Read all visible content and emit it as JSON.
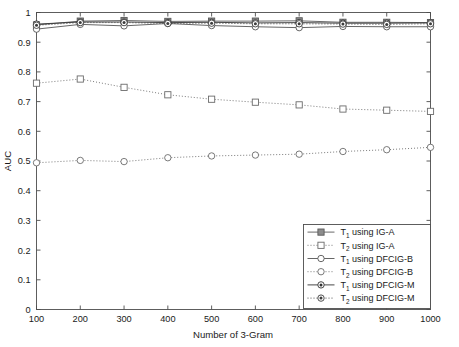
{
  "chart_data": {
    "type": "line",
    "title": "",
    "xlabel": "Number of 3-Gram",
    "ylabel": "AUC",
    "xlim": [
      100,
      1000
    ],
    "ylim": [
      0,
      1
    ],
    "grid": false,
    "legend_position": "lower right",
    "x": [
      100,
      200,
      300,
      400,
      500,
      600,
      700,
      800,
      900,
      1000
    ],
    "xticks": [
      "100",
      "200",
      "300",
      "400",
      "500",
      "600",
      "700",
      "800",
      "900",
      "1000"
    ],
    "yticks": [
      "0",
      "0.1",
      "0.2",
      "0.3",
      "0.4",
      "0.5",
      "0.6",
      "0.7",
      "0.8",
      "0.9",
      "1"
    ],
    "series": [
      {
        "name": "T_1 using IG-A",
        "label_main": "T",
        "label_sub": "1",
        "label_rest": " using IG-A",
        "line": "solid",
        "marker": "square-filled-gray",
        "color": "#595959",
        "values": [
          0.958,
          0.971,
          0.973,
          0.97,
          0.971,
          0.971,
          0.972,
          0.967,
          0.967,
          0.966
        ]
      },
      {
        "name": "T_2 using IG-A",
        "label_main": "T",
        "label_sub": "2",
        "label_rest": " using IG-A",
        "line": "dotted",
        "marker": "square-open",
        "color": "#6b6b6b",
        "values": [
          0.762,
          0.776,
          0.748,
          0.723,
          0.708,
          0.698,
          0.689,
          0.675,
          0.671,
          0.667
        ]
      },
      {
        "name": "T_1 using DFCIG-B",
        "label_main": "T",
        "label_sub": "1",
        "label_rest": " using DFCIG-B",
        "line": "solid",
        "marker": "circle-open",
        "color": "#555555",
        "values": [
          0.944,
          0.96,
          0.955,
          0.963,
          0.956,
          0.952,
          0.949,
          0.953,
          0.952,
          0.952
        ]
      },
      {
        "name": "T_2 using DFCIG-B",
        "label_main": "T",
        "label_sub": "2",
        "label_rest": " using DFCIG-B",
        "line": "dotted",
        "marker": "circle-open",
        "color": "#6b6b6b",
        "values": [
          0.494,
          0.502,
          0.498,
          0.511,
          0.517,
          0.52,
          0.523,
          0.532,
          0.538,
          0.546
        ]
      },
      {
        "name": "T_1 using DFCIG-M",
        "label_main": "T",
        "label_sub": "1",
        "label_rest": " using DFCIG-M",
        "line": "solid",
        "marker": "circle-filled",
        "color": "#333333",
        "values": [
          0.961,
          0.968,
          0.968,
          0.966,
          0.967,
          0.965,
          0.966,
          0.964,
          0.964,
          0.965
        ]
      },
      {
        "name": "T_2 using DFCIG-M",
        "label_main": "T",
        "label_sub": "2",
        "label_rest": " using DFCIG-M",
        "line": "dotted",
        "marker": "circle-filled",
        "color": "#3d3d3d",
        "values": [
          0.957,
          0.966,
          0.966,
          0.963,
          0.964,
          0.962,
          0.962,
          0.961,
          0.96,
          0.962
        ]
      }
    ]
  },
  "axes": {
    "y_title": "AUC",
    "x_title": "Number of 3-Gram"
  }
}
